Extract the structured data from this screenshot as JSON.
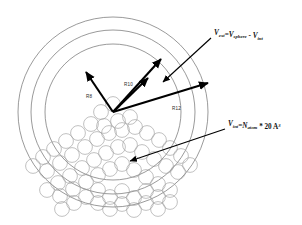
{
  "figure": {
    "type": "schematic-diagram",
    "background_color": "#ffffff"
  },
  "shells": {
    "center": {
      "x": 113,
      "y": 112
    },
    "items": [
      {
        "label": "R8",
        "radius": 68,
        "stroke": "#6e6e6e",
        "label_x": 86,
        "label_y": 98
      },
      {
        "label": "R10",
        "radius": 82,
        "stroke": "#6e6e6e",
        "label_x": 124,
        "label_y": 86
      },
      {
        "label": "R12",
        "radius": 95,
        "stroke": "#6e6e6e",
        "label_x": 172,
        "label_y": 110
      }
    ]
  },
  "radius_arrows": [
    {
      "name": "arrow-upper-left",
      "x1": 113,
      "y1": 112,
      "x2": 86,
      "y2": 72
    },
    {
      "name": "arrow-upper-right",
      "x1": 113,
      "y1": 112,
      "x2": 161,
      "y2": 59
    },
    {
      "name": "arrow-mid-right",
      "x1": 113,
      "y1": 112,
      "x2": 148,
      "y2": 78
    },
    {
      "name": "arrow-far-right",
      "x1": 113,
      "y1": 112,
      "x2": 208,
      "y2": 83
    }
  ],
  "annotations": [
    {
      "name": "v-ext-annotation",
      "text_plain": "Vext=Vsphere - Vint",
      "parts": [
        {
          "t": "V",
          "style": "var"
        },
        {
          "t": "ext",
          "style": "sub"
        },
        {
          "t": "=",
          "style": "op"
        },
        {
          "t": "V",
          "style": "var"
        },
        {
          "t": "sphere",
          "style": "sub"
        },
        {
          "t": " - ",
          "style": "op"
        },
        {
          "t": "V",
          "style": "var"
        },
        {
          "t": "int",
          "style": "sub"
        }
      ],
      "text_x": 214,
      "text_y": 35,
      "leader": {
        "x1": 211,
        "y1": 38,
        "x2": 163,
        "y2": 82
      }
    },
    {
      "name": "v-int-annotation",
      "text_plain": "Vint=Natom * 20 A3",
      "parts": [
        {
          "t": "V",
          "style": "var"
        },
        {
          "t": "int",
          "style": "sub"
        },
        {
          "t": "=",
          "style": "op"
        },
        {
          "t": "N",
          "style": "var"
        },
        {
          "t": "atom",
          "style": "sub"
        },
        {
          "t": " * 20 A",
          "style": "op"
        },
        {
          "t": "3",
          "style": "sup"
        }
      ],
      "text_x": 228,
      "text_y": 126,
      "leader": {
        "x1": 225,
        "y1": 129,
        "x2": 130,
        "y2": 161
      }
    }
  ],
  "atom_cluster": {
    "name": "atom-cluster",
    "description": "cluster of solvent/solute atoms filling lower region of sphere",
    "atom_radius": 7.4,
    "stroke": "#9a9a9a",
    "count": 62,
    "positions": [
      [
        113,
        104
      ],
      [
        101,
        112
      ],
      [
        104,
        126
      ],
      [
        118,
        121
      ],
      [
        130,
        117
      ],
      [
        91,
        124
      ],
      [
        78,
        133
      ],
      [
        66,
        141
      ],
      [
        54,
        149
      ],
      [
        43,
        157
      ],
      [
        33,
        166
      ],
      [
        47,
        171
      ],
      [
        60,
        163
      ],
      [
        72,
        155
      ],
      [
        85,
        147
      ],
      [
        97,
        139
      ],
      [
        109,
        133
      ],
      [
        122,
        130
      ],
      [
        135,
        127
      ],
      [
        147,
        133
      ],
      [
        159,
        140
      ],
      [
        170,
        148
      ],
      [
        181,
        156
      ],
      [
        190,
        165
      ],
      [
        178,
        172
      ],
      [
        166,
        166
      ],
      [
        154,
        159
      ],
      [
        142,
        152
      ],
      [
        130,
        145
      ],
      [
        118,
        147
      ],
      [
        106,
        153
      ],
      [
        94,
        160
      ],
      [
        82,
        168
      ],
      [
        70,
        176
      ],
      [
        58,
        183
      ],
      [
        47,
        190
      ],
      [
        60,
        196
      ],
      [
        73,
        189
      ],
      [
        86,
        182
      ],
      [
        98,
        175
      ],
      [
        110,
        169
      ],
      [
        122,
        164
      ],
      [
        134,
        170
      ],
      [
        146,
        177
      ],
      [
        158,
        184
      ],
      [
        170,
        190
      ],
      [
        158,
        197
      ],
      [
        146,
        191
      ],
      [
        134,
        198
      ],
      [
        122,
        191
      ],
      [
        110,
        197
      ],
      [
        98,
        190
      ],
      [
        86,
        197
      ],
      [
        74,
        203
      ],
      [
        62,
        209
      ],
      [
        98,
        203
      ],
      [
        110,
        209
      ],
      [
        122,
        204
      ],
      [
        134,
        210
      ],
      [
        146,
        203
      ],
      [
        158,
        209
      ],
      [
        170,
        202
      ]
    ]
  }
}
